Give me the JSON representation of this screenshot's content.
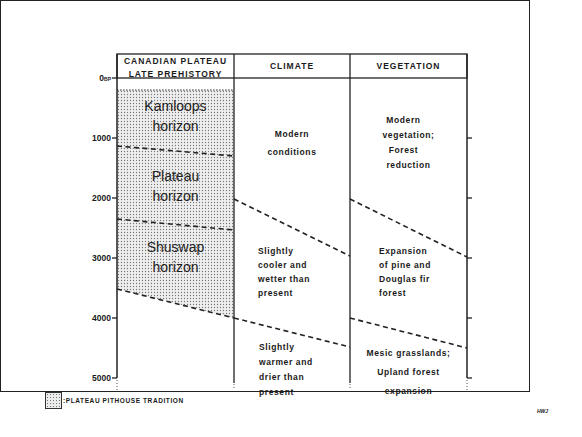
{
  "diagram": {
    "columns": [
      {
        "id": "plateau",
        "header_line1": "CANADIAN PLATEAU",
        "header_line2": "LATE PREHISTORY"
      },
      {
        "id": "climate",
        "header": "CLIMATE"
      },
      {
        "id": "vegetation",
        "header": "VEGETATION"
      }
    ],
    "y_axis": {
      "unit_label": "BP",
      "ticks": [
        "0",
        "1000",
        "2000",
        "3000",
        "4000",
        "5000"
      ]
    },
    "horizons": [
      {
        "line1": "Kamloops",
        "line2": "horizon"
      },
      {
        "line1": "Plateau",
        "line2": "horizon"
      },
      {
        "line1": "Shuswap",
        "line2": "horizon"
      }
    ],
    "climate": [
      {
        "lines": [
          "Modern",
          "conditions"
        ]
      },
      {
        "lines": [
          "Slightly",
          "cooler and",
          "wetter than",
          "present"
        ]
      },
      {
        "lines": [
          "Slightly",
          "warmer and",
          "drier than",
          "present"
        ]
      }
    ],
    "vegetation": [
      {
        "lines": [
          "Modern",
          "vegetation;",
          "Forest",
          "reduction"
        ]
      },
      {
        "lines": [
          "Expansion",
          "of pine and",
          "Douglas fir",
          "forest"
        ]
      },
      {
        "lines": [
          "Mesic grasslands;",
          "Upland forest",
          "expansion"
        ]
      }
    ],
    "legend": {
      "label": ":PLATEAU PITHOUSE TRADITION"
    },
    "signature": "HWJ",
    "colors": {
      "line": "#222222",
      "stipple": "#777777",
      "background": "#ffffff"
    }
  }
}
